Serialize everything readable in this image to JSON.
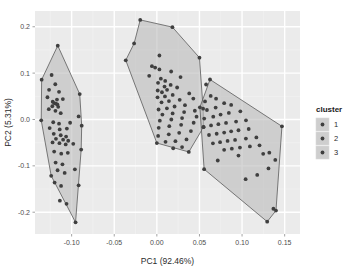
{
  "chart_data": {
    "type": "scatter",
    "title": "",
    "subtitle": "",
    "xlabel": "PC1 (92.46%)",
    "ylabel": "PC2 (5.31%)",
    "xlim": [
      -0.143,
      0.168
    ],
    "ylim": [
      -0.247,
      0.234
    ],
    "xticks": [
      -0.1,
      -0.05,
      0.0,
      0.05,
      0.1,
      0.15
    ],
    "xtick_labels": [
      "-0.10",
      "-0.05",
      "0.00",
      "0.05",
      "0.10",
      "0.15"
    ],
    "yticks": [
      -0.2,
      -0.1,
      0.0,
      0.1,
      0.2
    ],
    "ytick_labels": [
      "-0.2",
      "-0.1",
      "0.0",
      "0.1",
      "0.2"
    ],
    "grid": true,
    "grid_major_color": "#ffffff",
    "grid_minor_color": "#f2f2f2",
    "panel_background": "#ebebeb",
    "point_color": "#3f3f3f",
    "point_size": 1.9,
    "hull_fill": "#bdbdbd",
    "hull_fill_opacity": 0.62,
    "hull_stroke": "#5a5a5a",
    "legend": {
      "title": "cluster",
      "position": "right",
      "entries": [
        {
          "label": "1",
          "key_fill": "#bdbdbd",
          "point_color": "#3f3f3f"
        },
        {
          "label": "2",
          "key_fill": "#bdbdbd",
          "point_color": "#3f3f3f"
        },
        {
          "label": "3",
          "key_fill": "#bdbdbd",
          "point_color": "#3f3f3f"
        }
      ]
    },
    "series": [
      {
        "name": "1",
        "hull": [
          [
            -0.1163,
            0.1593
          ],
          [
            -0.0905,
            0.0548
          ],
          [
            -0.0882,
            -0.0133
          ],
          [
            -0.0888,
            -0.0648
          ],
          [
            -0.0954,
            -0.2219
          ],
          [
            -0.124,
            -0.1215
          ],
          [
            -0.1357,
            -0.0018
          ],
          [
            -0.1352,
            0.0859
          ]
        ],
        "points": [
          [
            -0.1163,
            0.1593
          ],
          [
            -0.1352,
            0.0859
          ],
          [
            -0.1235,
            0.096
          ],
          [
            -0.1192,
            0.076
          ],
          [
            -0.1265,
            0.0639
          ],
          [
            -0.1148,
            0.0597
          ],
          [
            -0.1284,
            0.048
          ],
          [
            -0.1172,
            0.043
          ],
          [
            -0.1103,
            0.044
          ],
          [
            -0.1222,
            0.0384
          ],
          [
            -0.1206,
            0.0355
          ],
          [
            -0.1186,
            0.034
          ],
          [
            -0.1168,
            0.0327
          ],
          [
            -0.1227,
            0.0286
          ],
          [
            -0.1158,
            0.0273
          ],
          [
            -0.1268,
            0.0223
          ],
          [
            -0.119,
            0.0187
          ],
          [
            -0.1128,
            0.0136
          ],
          [
            -0.0905,
            0.0548
          ],
          [
            -0.0918,
            0.0065
          ],
          [
            -0.1357,
            -0.0018
          ],
          [
            -0.1216,
            -0.006
          ],
          [
            -0.1148,
            -0.009
          ],
          [
            -0.1018,
            -0.007
          ],
          [
            -0.0882,
            -0.0133
          ],
          [
            -0.1258,
            -0.0186
          ],
          [
            -0.114,
            -0.0215
          ],
          [
            -0.1056,
            -0.0196
          ],
          [
            -0.121,
            -0.031
          ],
          [
            -0.1128,
            -0.034
          ],
          [
            -0.1065,
            -0.0368
          ],
          [
            -0.1184,
            -0.0418
          ],
          [
            -0.11,
            -0.0436
          ],
          [
            -0.104,
            -0.0459
          ],
          [
            -0.1224,
            -0.0495
          ],
          [
            -0.1143,
            -0.0512
          ],
          [
            -0.107,
            -0.0538
          ],
          [
            -0.0981,
            -0.0524
          ],
          [
            -0.0888,
            -0.0648
          ],
          [
            -0.1205,
            -0.0692
          ],
          [
            -0.1122,
            -0.0738
          ],
          [
            -0.1045,
            -0.072
          ],
          [
            -0.124,
            -0.1215
          ],
          [
            -0.1188,
            -0.093
          ],
          [
            -0.1108,
            -0.0968
          ],
          [
            -0.1165,
            -0.1095
          ],
          [
            -0.1082,
            -0.1152
          ],
          [
            -0.0962,
            -0.1074
          ],
          [
            -0.12,
            -0.136
          ],
          [
            -0.1124,
            -0.1432
          ],
          [
            -0.0918,
            -0.142
          ],
          [
            -0.1138,
            -0.1752
          ],
          [
            -0.106,
            -0.182
          ],
          [
            -0.0954,
            -0.2219
          ]
        ]
      },
      {
        "name": "2",
        "hull": [
          [
            -0.0195,
            0.2148
          ],
          [
            0.0183,
            0.1992
          ],
          [
            0.05,
            0.1333
          ],
          [
            0.0543,
            0.0234
          ],
          [
            0.0548,
            -0.0165
          ],
          [
            0.0375,
            -0.07
          ],
          [
            0.0,
            -0.0508
          ],
          [
            -0.0365,
            0.1277
          ],
          [
            -0.0267,
            0.164
          ]
        ],
        "points": [
          [
            -0.0195,
            0.2148
          ],
          [
            0.0183,
            0.1992
          ],
          [
            0.05,
            0.1333
          ],
          [
            -0.0365,
            0.1277
          ],
          [
            -0.0267,
            0.164
          ],
          [
            0.003,
            0.138
          ],
          [
            -0.0058,
            0.115
          ],
          [
            -0.002,
            0.112
          ],
          [
            0.003,
            0.108
          ],
          [
            0.0168,
            0.1035
          ],
          [
            0.0278,
            0.0915
          ],
          [
            -0.009,
            0.0942
          ],
          [
            0.0047,
            0.088
          ],
          [
            0.0098,
            0.0832
          ],
          [
            0.0014,
            0.079
          ],
          [
            0.0162,
            0.0745
          ],
          [
            0.009,
            0.071
          ],
          [
            0.0238,
            0.069
          ],
          [
            0.012,
            0.064
          ],
          [
            0.001,
            0.0625
          ],
          [
            0.006,
            0.0588
          ],
          [
            0.038,
            0.0562
          ],
          [
            0.0186,
            0.053
          ],
          [
            0.0095,
            0.0498
          ],
          [
            0.0008,
            0.0478
          ],
          [
            0.0428,
            0.0452
          ],
          [
            0.0268,
            0.0425
          ],
          [
            0.0142,
            0.0398
          ],
          [
            0.0055,
            0.037
          ],
          [
            0.0543,
            0.0234
          ],
          [
            0.033,
            0.0308
          ],
          [
            0.0208,
            0.028
          ],
          [
            0.0118,
            0.024
          ],
          [
            0.002,
            0.0215
          ],
          [
            0.0446,
            0.0188
          ],
          [
            0.032,
            0.016
          ],
          [
            0.0185,
            0.013
          ],
          [
            0.0065,
            0.0105
          ],
          [
            0.0466,
            0.006
          ],
          [
            0.0296,
            0.003
          ],
          [
            0.017,
            0.0
          ],
          [
            0.0035,
            -0.0025
          ],
          [
            0.0548,
            -0.0165
          ],
          [
            0.0432,
            -0.007
          ],
          [
            0.0285,
            -0.0115
          ],
          [
            0.0146,
            -0.0145
          ],
          [
            0.0022,
            -0.018
          ],
          [
            0.04,
            -0.025
          ],
          [
            0.0262,
            -0.0288
          ],
          [
            0.014,
            -0.032
          ],
          [
            0.0015,
            -0.0355
          ],
          [
            0.0,
            -0.0508
          ],
          [
            0.0348,
            -0.043
          ],
          [
            0.0218,
            -0.0468
          ],
          [
            0.0102,
            -0.0482
          ],
          [
            0.0375,
            -0.07
          ],
          [
            0.0296,
            -0.0595
          ],
          [
            0.0192,
            -0.062
          ]
        ]
      },
      {
        "name": "3",
        "hull": [
          [
            0.0624,
            0.0862
          ],
          [
            0.1468,
            -0.0148
          ],
          [
            0.1398,
            -0.1965
          ],
          [
            0.1295,
            -0.2204
          ],
          [
            0.0555,
            -0.1072
          ],
          [
            0.0505,
            0.0262
          ]
        ],
        "points": [
          [
            0.0624,
            0.0862
          ],
          [
            0.1468,
            -0.0148
          ],
          [
            0.0505,
            0.0262
          ],
          [
            0.0555,
            -0.1072
          ],
          [
            0.1295,
            -0.2204
          ],
          [
            0.1398,
            -0.1965
          ],
          [
            0.0578,
            0.0755
          ],
          [
            0.0632,
            0.0508
          ],
          [
            0.0695,
            0.0448
          ],
          [
            0.0565,
            0.039
          ],
          [
            0.079,
            0.0352
          ],
          [
            0.0872,
            0.0315
          ],
          [
            0.069,
            0.0258
          ],
          [
            0.0588,
            0.0205
          ],
          [
            0.098,
            0.0175
          ],
          [
            0.0845,
            0.0142
          ],
          [
            0.0748,
            0.0105
          ],
          [
            0.0662,
            0.006
          ],
          [
            0.0556,
            0.002
          ],
          [
            0.1046,
            -0.0018
          ],
          [
            0.093,
            -0.0045
          ],
          [
            0.0812,
            -0.0075
          ],
          [
            0.0722,
            -0.0102
          ],
          [
            0.0636,
            -0.0128
          ],
          [
            0.0548,
            -0.0158
          ],
          [
            0.1078,
            -0.0205
          ],
          [
            0.0958,
            -0.0232
          ],
          [
            0.0872,
            -0.0255
          ],
          [
            0.079,
            -0.0282
          ],
          [
            0.0702,
            -0.0308
          ],
          [
            0.0612,
            -0.0335
          ],
          [
            0.1168,
            -0.0388
          ],
          [
            0.1045,
            -0.0412
          ],
          [
            0.0918,
            -0.044
          ],
          [
            0.083,
            -0.0462
          ],
          [
            0.0742,
            -0.049
          ],
          [
            0.0658,
            -0.0515
          ],
          [
            0.1205,
            -0.0558
          ],
          [
            0.1092,
            -0.0582
          ],
          [
            0.0975,
            -0.0605
          ],
          [
            0.088,
            -0.063
          ],
          [
            0.079,
            -0.0655
          ],
          [
            0.132,
            -0.0715
          ],
          [
            0.1248,
            -0.074
          ],
          [
            0.0958,
            -0.0778
          ],
          [
            0.139,
            -0.0872
          ],
          [
            0.0715,
            -0.0885
          ],
          [
            0.131,
            -0.1055
          ],
          [
            0.1178,
            -0.1195
          ],
          [
            0.1042,
            -0.1288
          ],
          [
            0.1368,
            -0.1925
          ]
        ]
      }
    ]
  }
}
